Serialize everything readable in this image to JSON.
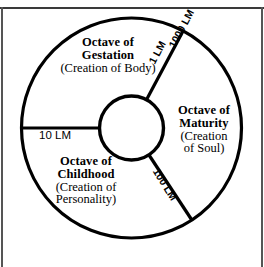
{
  "diagram": {
    "type": "concentric-wheel",
    "sectors": [
      {
        "id": "gestation",
        "title": "Octave of\nGestation",
        "title_line1": "Octave of",
        "title_line2": "Gestation",
        "subtitle": "(Creation of Body)",
        "position": "upper-left"
      },
      {
        "id": "maturity",
        "title_line1": "Octave of",
        "title_line2": "Maturity",
        "subtitle_line1": "(Creation",
        "subtitle_line2": "of Soul)",
        "position": "right"
      },
      {
        "id": "childhood",
        "title_line1": "Octave of",
        "title_line2": "Childhood",
        "subtitle_line1": "(Creation of",
        "subtitle_line2": "Personality)",
        "position": "lower-left"
      }
    ],
    "boundary_ticks": [
      {
        "id": "tick-10lm",
        "label": "10 LM",
        "position": "left-horizontal"
      },
      {
        "id": "tick-1lm",
        "label": "1 LM",
        "position": "upper-right-inner"
      },
      {
        "id": "tick-1000lm",
        "label": "1000 LM",
        "position": "upper-right-outer"
      },
      {
        "id": "tick-100lm",
        "label": "100 LM",
        "position": "lower-right"
      }
    ],
    "colors": {
      "stroke": "#000000",
      "background": "#ffffff",
      "rule": "#3a3a3a"
    }
  }
}
